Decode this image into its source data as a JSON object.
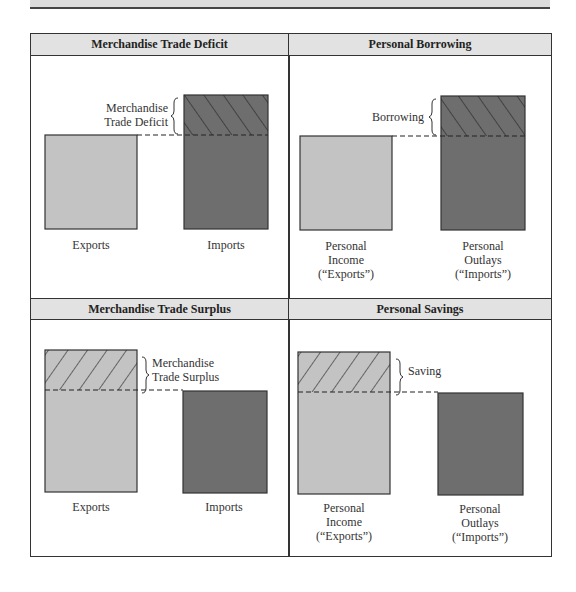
{
  "panels": [
    {
      "title": "Merchandise Trade Deficit",
      "left_label": [
        "Exports"
      ],
      "right_label": [
        "Imports"
      ],
      "bracket_label": [
        "Merchandise",
        "Trade Deficit"
      ]
    },
    {
      "title": "Personal Borrowing",
      "left_label": [
        "Personal",
        "Income",
        "(“Exports”)"
      ],
      "right_label": [
        "Personal",
        "Outlays",
        "(“Imports”)"
      ],
      "bracket_label": [
        "Borrowing"
      ]
    },
    {
      "title": "Merchandise Trade Surplus",
      "left_label": [
        "Exports"
      ],
      "right_label": [
        "Imports"
      ],
      "bracket_label": [
        "Merchandise",
        "Trade Surplus"
      ]
    },
    {
      "title": "Personal Savings",
      "left_label": [
        "Personal",
        "Income",
        "(“Exports”)"
      ],
      "right_label": [
        "Personal",
        "Outlays",
        "(“Imports”)"
      ],
      "bracket_label": [
        "Saving"
      ]
    }
  ],
  "colors": {
    "exports_fill": "#c3c3c3",
    "imports_fill": "#6e6e6e",
    "header_fill": "#e2e2e2",
    "border": "#333333"
  }
}
